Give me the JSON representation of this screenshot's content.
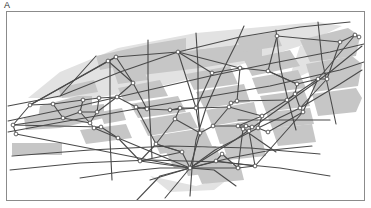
{
  "figure": {
    "panel_label": "A",
    "caption": "",
    "type": "street-network-map"
  },
  "colors": {
    "frame_stroke": "#8b8b8b",
    "block_fill": "#c6c6c6",
    "block_fill_light": "#e2e2e2",
    "edge_stroke": "#4a4a4a",
    "node_stroke": "#3c3c3c",
    "node_fill": "#ffffff",
    "background": "#ffffff",
    "label_color": "#2b2b2b"
  },
  "frame": {
    "x": 6,
    "y": 11,
    "width": 359,
    "height": 190,
    "stroke_width": 1.2
  },
  "style": {
    "edge_width": 1.1,
    "node_radius": 1.9,
    "node_stroke_width": 0.8
  },
  "map_data": {
    "blocks_light": [
      "M 28,98 L 60,72 L 118,48 L 196,33 L 262,27 L 318,22 L 342,26 L 300,46 L 236,66 L 170,84 L 96,98 Z",
      "M 300,46 L 345,30 L 360,40 L 330,62 L 288,82 Z",
      "M 150,176 L 196,186 L 232,176 L 214,190 L 170,192 Z"
    ],
    "blocks": [
      "M 96,56 L 150,44 L 186,38 L 186,54 L 140,62 L 100,70 Z",
      "M 130,60 L 196,50 L 262,42 L 262,58 L 200,68 L 134,76 Z",
      "M 196,50 L 250,44 L 258,58 L 206,66 Z",
      "M 40,106 L 78,96 L 92,96 L 92,110 L 52,120 L 38,118 Z",
      "M 24,118 L 70,108 L 104,104 L 104,118 L 60,128 L 26,130 Z",
      "M 112,66 L 140,62 L 148,80 L 118,84 Z",
      "M 118,88 L 160,80 L 168,96 L 124,102 Z",
      "M 130,104 L 178,96 L 186,112 L 138,118 Z",
      "M 140,120 L 190,112 L 198,128 L 148,136 Z",
      "M 152,136 L 204,128 L 212,146 L 160,154 Z",
      "M 166,152 L 216,146 L 222,162 L 174,168 Z",
      "M 186,74 L 230,66 L 238,84 L 194,90 Z",
      "M 196,92 L 244,84 L 250,102 L 204,108 Z",
      "M 206,110 L 254,102 L 258,118 L 212,126 Z",
      "M 214,126 L 258,120 L 262,138 L 220,144 Z",
      "M 222,142 L 262,138 L 266,156 L 228,160 Z",
      "M 244,60 L 290,50 L 300,66 L 252,76 Z",
      "M 252,78 L 298,70 L 306,88 L 258,94 Z",
      "M 260,96 L 304,90 L 310,106 L 266,112 Z",
      "M 266,112 L 310,108 L 314,124 L 272,128 Z",
      "M 272,128 L 312,124 L 316,142 L 278,146 Z",
      "M 300,40 L 348,28 L 360,36 L 356,56 L 310,62 Z",
      "M 306,64 L 352,56 L 362,64 L 358,86 L 314,92 Z",
      "M 312,94 L 356,88 L 362,98 L 356,112 L 318,116 Z",
      "M 12,143 L 62,143 L 62,155 L 12,155 Z",
      "M 80,130 L 126,124 L 132,138 L 86,144 Z",
      "M 58,88 L 94,80 L 98,92 L 62,98 Z",
      "M 100,112 L 122,108 L 126,120 L 104,124 Z",
      "M 236,38 L 276,32 L 282,46 L 242,52 Z",
      "M 182,160 L 228,154 L 234,170 L 188,176 Z",
      "M 196,170 L 240,164 L 244,180 L 202,184 Z"
    ],
    "nodes": [
      {
        "id": 0,
        "x": 13,
        "y": 125
      },
      {
        "id": 1,
        "x": 30,
        "y": 105
      },
      {
        "id": 2,
        "x": 53,
        "y": 104
      },
      {
        "id": 3,
        "x": 63,
        "y": 118
      },
      {
        "id": 4,
        "x": 80,
        "y": 112
      },
      {
        "id": 5,
        "x": 83,
        "y": 100
      },
      {
        "id": 6,
        "x": 90,
        "y": 123
      },
      {
        "id": 7,
        "x": 94,
        "y": 128
      },
      {
        "id": 8,
        "x": 101,
        "y": 127
      },
      {
        "id": 9,
        "x": 97,
        "y": 112
      },
      {
        "id": 10,
        "x": 99,
        "y": 98
      },
      {
        "id": 11,
        "x": 108,
        "y": 61
      },
      {
        "id": 12,
        "x": 116,
        "y": 57
      },
      {
        "id": 13,
        "x": 117,
        "y": 97
      },
      {
        "id": 14,
        "x": 118,
        "y": 138
      },
      {
        "id": 15,
        "x": 133,
        "y": 83
      },
      {
        "id": 16,
        "x": 136,
        "y": 107
      },
      {
        "id": 17,
        "x": 140,
        "y": 161
      },
      {
        "id": 18,
        "x": 147,
        "y": 109
      },
      {
        "id": 19,
        "x": 156,
        "y": 144
      },
      {
        "id": 20,
        "x": 170,
        "y": 110
      },
      {
        "id": 21,
        "x": 175,
        "y": 119
      },
      {
        "id": 22,
        "x": 178,
        "y": 52
      },
      {
        "id": 23,
        "x": 180,
        "y": 108
      },
      {
        "id": 24,
        "x": 182,
        "y": 152
      },
      {
        "id": 25,
        "x": 190,
        "y": 168
      },
      {
        "id": 26,
        "x": 196,
        "y": 108
      },
      {
        "id": 27,
        "x": 200,
        "y": 133
      },
      {
        "id": 28,
        "x": 213,
        "y": 126
      },
      {
        "id": 29,
        "x": 216,
        "y": 161
      },
      {
        "id": 30,
        "x": 222,
        "y": 154
      },
      {
        "id": 31,
        "x": 229,
        "y": 107
      },
      {
        "id": 32,
        "x": 231,
        "y": 103
      },
      {
        "id": 33,
        "x": 237,
        "y": 101
      },
      {
        "id": 34,
        "x": 238,
        "y": 126
      },
      {
        "id": 35,
        "x": 240,
        "y": 68
      },
      {
        "id": 36,
        "x": 243,
        "y": 129
      },
      {
        "id": 37,
        "x": 246,
        "y": 126
      },
      {
        "id": 38,
        "x": 249,
        "y": 131
      },
      {
        "id": 39,
        "x": 252,
        "y": 127
      },
      {
        "id": 40,
        "x": 238,
        "y": 168
      },
      {
        "id": 41,
        "x": 255,
        "y": 166
      },
      {
        "id": 42,
        "x": 262,
        "y": 116
      },
      {
        "id": 43,
        "x": 268,
        "y": 71
      },
      {
        "id": 44,
        "x": 277,
        "y": 36
      },
      {
        "id": 45,
        "x": 287,
        "y": 100
      },
      {
        "id": 46,
        "x": 295,
        "y": 94
      },
      {
        "id": 47,
        "x": 297,
        "y": 84
      },
      {
        "id": 48,
        "x": 300,
        "y": 108
      },
      {
        "id": 49,
        "x": 303,
        "y": 112
      },
      {
        "id": 50,
        "x": 318,
        "y": 79
      },
      {
        "id": 51,
        "x": 327,
        "y": 79
      },
      {
        "id": 52,
        "x": 340,
        "y": 42
      },
      {
        "id": 53,
        "x": 355,
        "y": 35
      },
      {
        "id": 54,
        "x": 359,
        "y": 37
      },
      {
        "id": 55,
        "x": 16,
        "y": 134
      },
      {
        "id": 56,
        "x": 212,
        "y": 73
      },
      {
        "id": 57,
        "x": 258,
        "y": 128
      },
      {
        "id": 58,
        "x": 268,
        "y": 132
      }
    ],
    "edges": [
      [
        1,
        2
      ],
      [
        2,
        3
      ],
      [
        3,
        0
      ],
      [
        0,
        55
      ],
      [
        2,
        5
      ],
      [
        5,
        4
      ],
      [
        4,
        3
      ],
      [
        4,
        6
      ],
      [
        6,
        7
      ],
      [
        7,
        8
      ],
      [
        5,
        10
      ],
      [
        10,
        9
      ],
      [
        9,
        4
      ],
      [
        9,
        13
      ],
      [
        13,
        15
      ],
      [
        15,
        11
      ],
      [
        11,
        12
      ],
      [
        12,
        22
      ],
      [
        22,
        35
      ],
      [
        35,
        43
      ],
      [
        43,
        44
      ],
      [
        44,
        52
      ],
      [
        52,
        53
      ],
      [
        53,
        54
      ],
      [
        1,
        12
      ],
      [
        1,
        11
      ],
      [
        30,
        29
      ],
      [
        13,
        16
      ],
      [
        16,
        18
      ],
      [
        18,
        20
      ],
      [
        20,
        23
      ],
      [
        23,
        26
      ],
      [
        26,
        31
      ],
      [
        31,
        32
      ],
      [
        32,
        33
      ],
      [
        33,
        35
      ],
      [
        33,
        45
      ],
      [
        45,
        46
      ],
      [
        46,
        47
      ],
      [
        47,
        43
      ],
      [
        46,
        48
      ],
      [
        48,
        49
      ],
      [
        49,
        50
      ],
      [
        50,
        51
      ],
      [
        51,
        52
      ],
      [
        50,
        47
      ],
      [
        8,
        14
      ],
      [
        14,
        17
      ],
      [
        17,
        24
      ],
      [
        24,
        25
      ],
      [
        25,
        29
      ],
      [
        29,
        30
      ],
      [
        30,
        40
      ],
      [
        40,
        41
      ],
      [
        16,
        19
      ],
      [
        19,
        24
      ],
      [
        19,
        21
      ],
      [
        21,
        23
      ],
      [
        21,
        27
      ],
      [
        27,
        28
      ],
      [
        28,
        34
      ],
      [
        34,
        36
      ],
      [
        36,
        38
      ],
      [
        38,
        39
      ],
      [
        39,
        37
      ],
      [
        37,
        34
      ],
      [
        34,
        42
      ],
      [
        42,
        57
      ],
      [
        57,
        58
      ],
      [
        58,
        49
      ],
      [
        42,
        45
      ],
      [
        28,
        31
      ],
      [
        27,
        25
      ],
      [
        25,
        17
      ],
      [
        25,
        40
      ],
      [
        56,
        35
      ],
      [
        56,
        22
      ],
      [
        56,
        26
      ],
      [
        15,
        18
      ],
      [
        6,
        9
      ],
      [
        55,
        25
      ],
      [
        0,
        8
      ],
      [
        14,
        25
      ],
      [
        41,
        49
      ],
      [
        29,
        41
      ],
      [
        24,
        19
      ],
      [
        20,
        26
      ],
      [
        26,
        27
      ],
      [
        36,
        40
      ],
      [
        38,
        41
      ],
      [
        1,
        0
      ],
      [
        3,
        6
      ],
      [
        10,
        13
      ],
      [
        12,
        15
      ],
      [
        22,
        26
      ],
      [
        31,
        42
      ],
      [
        45,
        50
      ],
      [
        48,
        51
      ],
      [
        53,
        50
      ],
      [
        43,
        47
      ],
      [
        7,
        14
      ],
      [
        17,
        19
      ]
    ],
    "long_lines": [
      "M 8,106 L 60,96 L 120,72 L 178,52 L 240,37 L 300,27 L 350,22",
      "M 8,121 L 70,108 L 140,92 L 210,76 L 268,64 L 330,52 L 364,44",
      "M 8,132 L 62,122 L 130,110 L 200,98 L 270,86 L 340,70 L 364,62",
      "M 10,170 L 80,163 L 150,160 L 220,162 L 280,168 L 330,176",
      "M 12,156 L 90,150 L 170,146 L 250,148 L 320,154",
      "M 137,200 L 160,176 L 190,168 L 235,140 L 280,108 L 330,72 L 362,46",
      "M 165,198 L 190,168 L 215,150 L 258,128 L 300,108 L 340,84 L 362,70",
      "M 190,196 L 192,168 L 196,140 L 206,108 L 220,76 L 236,44 L 244,26",
      "M 236,186 L 214,170 L 190,168 L 160,168 L 120,172 L 80,178",
      "M 150,180 L 190,168 L 230,158 L 272,150 L 312,146",
      "M 110,60 L 110,140 L 112,180",
      "M 148,40 L 148,78 L 150,120 L 152,158",
      "M 196,33 L 198,66 L 198,104 L 200,136",
      "M 276,30 L 280,66 L 288,100 L 296,130",
      "M 318,22 L 322,60 L 330,96 L 336,124",
      "M 60,96 L 96,56",
      "M 238,120 L 330,120",
      "M 250,134 L 276,152"
    ]
  }
}
